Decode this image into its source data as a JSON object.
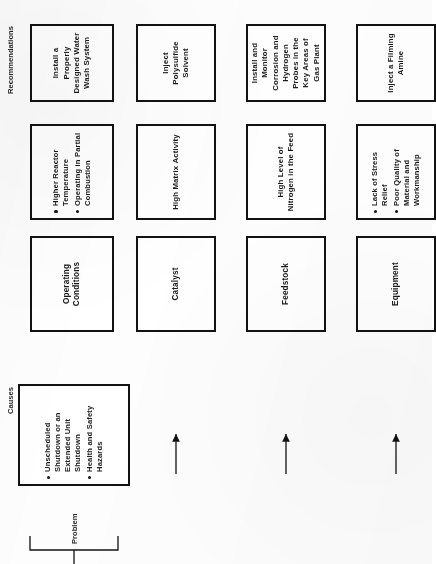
{
  "document": {
    "kind": "cause-and-recommendation-diagram",
    "orientation": "rotated-90-ccw"
  },
  "row_labels": {
    "problem": "Problem",
    "causes": "Causes",
    "recommendations": "Recommendations"
  },
  "problem": {
    "bullets": [
      "Unscheduled Shutdown or an Extended Unit Shutdown",
      "Health and Safety Hazards"
    ]
  },
  "causes": [
    {
      "category": "Operating Conditions",
      "detail_bullets": [
        "Higher Reactor Temperature",
        "Operating in Partial Combustion"
      ]
    },
    {
      "category": "Catalyst",
      "detail_text": "High Matrix Activity"
    },
    {
      "category": "Feedstock",
      "detail_text": "High Level of Nitrogen in the Feed"
    },
    {
      "category": "Equipment",
      "detail_bullets": [
        "Lack of Stress Relief",
        "Poor Quality of Material and Workmanship"
      ]
    }
  ],
  "recommendations": [
    "Install a Properly Designed Water Wash System",
    "Inject Polysulfide Solvent",
    "Install and Monitor Corrosion and Hydrogen Probes in the Key Areas of Gas Plant",
    "Inject a Filming Amine"
  ],
  "colors": {
    "ink": "#121212",
    "paper": "#fdfdfd"
  }
}
